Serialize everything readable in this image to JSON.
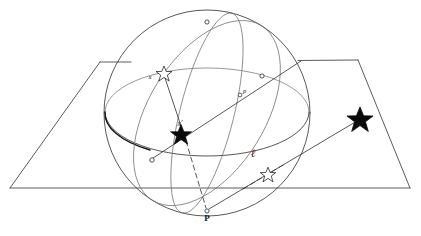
{
  "figure": {
    "domain_type": "diagram",
    "canvas": {
      "width": 421,
      "height": 236
    },
    "background_color": "#ffffff",
    "ink_color": "#2b2b2b"
  },
  "labels": {
    "point_x": "x",
    "point_x_prime": "x′",
    "point_p_lower": "p",
    "point_P": "P",
    "line_ell": "ℓ"
  },
  "elements": {
    "sphere": {
      "name": "celestial-sphere",
      "center": [
        207,
        113
      ],
      "radius": 103,
      "outline_color": "#3a3a3a"
    },
    "plane": {
      "name": "tangent-plane",
      "shape": "trapezoid",
      "corners": [
        [
          100,
          62
        ],
        [
          358,
          60
        ],
        [
          410,
          188
        ],
        [
          10,
          188
        ]
      ]
    },
    "equator": {
      "name": "equator-ellipse",
      "center": [
        207,
        112
      ],
      "rx": 102,
      "ry": 44,
      "front_arc_is_bold": true
    },
    "meridian_great_circle": {
      "name": "oblique-great-circle",
      "center": [
        207,
        113
      ],
      "rx": 103,
      "ry": 58,
      "rotation_deg": -58
    },
    "secondary_meridian": {
      "name": "secondary-meridian",
      "center": [
        207,
        113
      ],
      "rx": 103,
      "ry": 27,
      "rotation_deg": -76
    },
    "markers": [
      {
        "name": "node-top",
        "x": 207,
        "y": 22,
        "r": 2.1,
        "label": ""
      },
      {
        "name": "node-right",
        "x": 262,
        "y": 76,
        "r": 2.1,
        "label": ""
      },
      {
        "name": "node-left-equator",
        "x": 152,
        "y": 160,
        "r": 2.1,
        "label": ""
      },
      {
        "name": "node-mid-ray",
        "x": 240,
        "y": 95,
        "r": 1.9,
        "label": "p"
      },
      {
        "name": "node-bottom-P",
        "x": 207,
        "y": 211,
        "r": 2.1,
        "label": "P"
      }
    ],
    "stars": [
      {
        "name": "star-x-hollow-on-sphere",
        "x": 163,
        "y": 73,
        "size": 8,
        "style": "hollow",
        "label": "x"
      },
      {
        "name": "star-x-prime-filled",
        "x": 180,
        "y": 135,
        "size": 11,
        "style": "filled",
        "label": "x′"
      },
      {
        "name": "star-hollow-on-plane",
        "x": 268,
        "y": 175,
        "size": 8,
        "style": "hollow",
        "label": ""
      },
      {
        "name": "star-filled-on-plane",
        "x": 360,
        "y": 120,
        "size": 13,
        "style": "filled",
        "label": ""
      }
    ],
    "rays": [
      {
        "name": "ray-center-to-upper-right",
        "from": [
          152,
          160
        ],
        "to": [
          300,
          62
        ],
        "style": "solid"
      },
      {
        "name": "ray-star-to-P",
        "from": [
          163,
          73
        ],
        "to": [
          207,
          211
        ],
        "style": "dashed"
      },
      {
        "name": "ray-P-to-plane-star",
        "from": [
          207,
          211
        ],
        "to": [
          360,
          120
        ],
        "style": "solid"
      },
      {
        "name": "ray-x-to-xprime-chord",
        "from": [
          163,
          73
        ],
        "to": [
          185,
          140
        ],
        "style": "solid"
      }
    ]
  }
}
